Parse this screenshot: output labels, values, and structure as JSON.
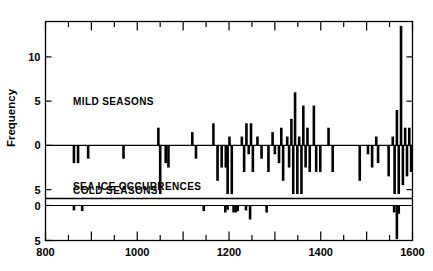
{
  "chart_data": {
    "type": "bar",
    "title": "",
    "subtitle": "",
    "xlabel": "",
    "ylabel": "Frequency",
    "xlim": [
      800,
      1600
    ],
    "xticks": [
      800,
      1000,
      1200,
      1400,
      1600
    ],
    "xticklabels": [
      "800",
      "1000",
      "1200",
      "1400",
      "1600"
    ],
    "xminor_step": 50,
    "grid": false,
    "legend": "none",
    "annotations": [
      "MILD SEASONS",
      "COLD SEASONS",
      "SEA ICE OCCURRENCES"
    ],
    "panels": [
      {
        "name": "seasons",
        "ylim": [
          -6,
          14
        ],
        "yticks": [
          10,
          5,
          0,
          -5
        ],
        "yticklabels": [
          "10",
          "5",
          "0",
          "5"
        ],
        "labels_inside": [
          {
            "text": "MILD SEASONS",
            "x": 860,
            "y": 5
          },
          {
            "text": "COLD SEASONS",
            "x": 860,
            "y": -5
          }
        ],
        "series": [
          {
            "name": "Mild seasons (positive) and Cold seasons (negative)",
            "bar_width_years": 9,
            "points": [
              {
                "x": 862,
                "y": -2
              },
              {
                "x": 871,
                "y": -2
              },
              {
                "x": 893,
                "y": -1.5
              },
              {
                "x": 970,
                "y": -1.5
              },
              {
                "x": 1046,
                "y": 2
              },
              {
                "x": 1050,
                "y": -5.5
              },
              {
                "x": 1062,
                "y": -2
              },
              {
                "x": 1068,
                "y": -2.5
              },
              {
                "x": 1120,
                "y": 1.5
              },
              {
                "x": 1128,
                "y": -1.5
              },
              {
                "x": 1166,
                "y": 2.5
              },
              {
                "x": 1175,
                "y": -4
              },
              {
                "x": 1184,
                "y": -2.5
              },
              {
                "x": 1193,
                "y": -2.5
              },
              {
                "x": 1197,
                "y": -5.5
              },
              {
                "x": 1201,
                "y": 1
              },
              {
                "x": 1206,
                "y": -5.5
              },
              {
                "x": 1228,
                "y": 1
              },
              {
                "x": 1233,
                "y": -3
              },
              {
                "x": 1238,
                "y": 2.5
              },
              {
                "x": 1243,
                "y": -1
              },
              {
                "x": 1248,
                "y": 2.5
              },
              {
                "x": 1252,
                "y": -3
              },
              {
                "x": 1262,
                "y": 1
              },
              {
                "x": 1271,
                "y": -1.5
              },
              {
                "x": 1286,
                "y": -3
              },
              {
                "x": 1295,
                "y": 1.5
              },
              {
                "x": 1300,
                "y": -1
              },
              {
                "x": 1309,
                "y": -2
              },
              {
                "x": 1314,
                "y": 2
              },
              {
                "x": 1318,
                "y": -4
              },
              {
                "x": 1327,
                "y": 1
              },
              {
                "x": 1331,
                "y": -2.5
              },
              {
                "x": 1336,
                "y": 3
              },
              {
                "x": 1340,
                "y": -5.5
              },
              {
                "x": 1344,
                "y": 6
              },
              {
                "x": 1349,
                "y": -5.5
              },
              {
                "x": 1353,
                "y": 1
              },
              {
                "x": 1358,
                "y": -5.5
              },
              {
                "x": 1362,
                "y": 4.5
              },
              {
                "x": 1367,
                "y": -2.5
              },
              {
                "x": 1371,
                "y": 2
              },
              {
                "x": 1376,
                "y": -3
              },
              {
                "x": 1385,
                "y": 4.5
              },
              {
                "x": 1390,
                "y": -3
              },
              {
                "x": 1399,
                "y": -3
              },
              {
                "x": 1417,
                "y": 2
              },
              {
                "x": 1426,
                "y": -3
              },
              {
                "x": 1485,
                "y": -4
              },
              {
                "x": 1503,
                "y": -1
              },
              {
                "x": 1512,
                "y": -2.5
              },
              {
                "x": 1521,
                "y": 1
              },
              {
                "x": 1525,
                "y": -2
              },
              {
                "x": 1548,
                "y": -3.5
              },
              {
                "x": 1557,
                "y": 1
              },
              {
                "x": 1561,
                "y": -5.5
              },
              {
                "x": 1566,
                "y": 4
              },
              {
                "x": 1570,
                "y": -5.5
              },
              {
                "x": 1575,
                "y": 13.5
              },
              {
                "x": 1579,
                "y": -4.5
              },
              {
                "x": 1584,
                "y": 2
              },
              {
                "x": 1588,
                "y": -3.5
              },
              {
                "x": 1593,
                "y": 2
              },
              {
                "x": 1597,
                "y": -3
              }
            ]
          }
        ]
      },
      {
        "name": "sea_ice",
        "ylim": [
          -5,
          1
        ],
        "yticks": [
          0,
          -5
        ],
        "yticklabels": [
          "0",
          "5"
        ],
        "labels_inside": [
          {
            "text": "SEA ICE OCCURRENCES",
            "x": 860,
            "y": 0
          }
        ],
        "series": [
          {
            "name": "Sea ice occurrences",
            "bar_width_years": 9,
            "points": [
              {
                "x": 862,
                "y": -0.7
              },
              {
                "x": 880,
                "y": -0.8
              },
              {
                "x": 1145,
                "y": -0.8
              },
              {
                "x": 1192,
                "y": -1.0
              },
              {
                "x": 1197,
                "y": -0.6
              },
              {
                "x": 1210,
                "y": -1.0
              },
              {
                "x": 1215,
                "y": -1.0
              },
              {
                "x": 1219,
                "y": -0.8
              },
              {
                "x": 1237,
                "y": -0.7
              },
              {
                "x": 1246,
                "y": -2.0
              },
              {
                "x": 1282,
                "y": -1.0
              },
              {
                "x": 1560,
                "y": -1.0
              },
              {
                "x": 1566,
                "y": -4.8
              },
              {
                "x": 1570,
                "y": -1.2
              }
            ]
          }
        ]
      }
    ]
  },
  "axis": {
    "y_title": "Frequency",
    "x_tick_labels": [
      "800",
      "1000",
      "1200",
      "1400",
      "1600"
    ],
    "y_tick_labels_top_panel": [
      "10",
      "5",
      "0",
      "5"
    ],
    "y_tick_labels_bottom_panel": [
      "0",
      "5"
    ]
  },
  "panel_text": {
    "mild": "MILD SEASONS",
    "cold": "COLD SEASONS",
    "sea_ice": "SEA ICE OCCURRENCES"
  },
  "colors": {
    "bar": "#000000",
    "axis": "#000000",
    "background": "#ffffff"
  }
}
